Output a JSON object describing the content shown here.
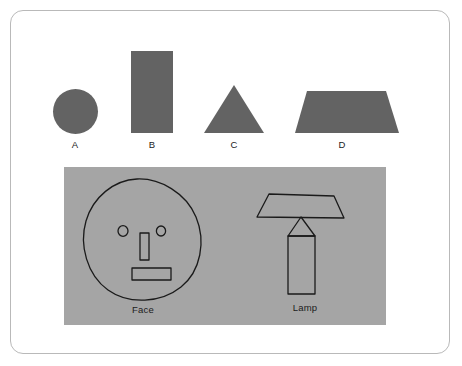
{
  "page": {
    "background_color": "#ffffff",
    "border_color": "#b9b9b9"
  },
  "shapes_row": {
    "fill_color": "#636363",
    "items": [
      {
        "label": "A",
        "shape": "circle"
      },
      {
        "label": "B",
        "shape": "rectangle"
      },
      {
        "label": "C",
        "shape": "triangle"
      },
      {
        "label": "D",
        "shape": "trapezoid"
      }
    ]
  },
  "panel": {
    "background_color": "#a5a5a5",
    "stroke_color": "#1a1a1a",
    "drawings": [
      {
        "caption": "Face",
        "parts": [
          "head-circle",
          "left-eye",
          "right-eye",
          "nose-rectangle",
          "mouth-rectangle"
        ]
      },
      {
        "caption": "Lamp",
        "parts": [
          "lamp-shade-trapezoid",
          "lamp-neck-triangle",
          "lamp-body-rectangle"
        ]
      }
    ]
  }
}
